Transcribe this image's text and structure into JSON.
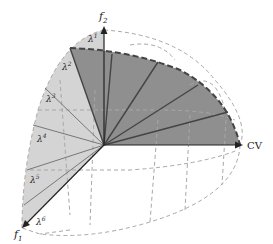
{
  "diagram": {
    "title": "",
    "axes": {
      "f2": {
        "label": "f",
        "sub": "2"
      },
      "f1": {
        "label": "f",
        "sub": "1"
      },
      "cv": {
        "label": "CV"
      }
    },
    "lambda_labels": [
      {
        "base": "λ",
        "sup": "1"
      },
      {
        "base": "λ",
        "sup": "2"
      },
      {
        "base": "λ",
        "sup": "3"
      },
      {
        "base": "λ",
        "sup": "4"
      },
      {
        "base": "λ",
        "sup": "5"
      },
      {
        "base": "λ",
        "sup": "6"
      }
    ],
    "colors": {
      "dark_region": "#8f8f8f",
      "light_region": "#d4d4d4",
      "axis": "#222222",
      "grid_dashed": "#a8a8a8",
      "fan_line": "#555555",
      "front_dashed": "#444444"
    }
  }
}
